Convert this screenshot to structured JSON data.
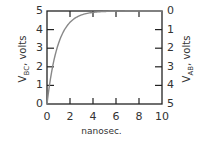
{
  "chart_data": {
    "type": "line",
    "title": "",
    "xlabel": "nanosec.",
    "ylabel_left": "V_BC, volts",
    "ylabel_right": "V_AB, volts",
    "xlim": [
      0,
      10
    ],
    "ylim_left": [
      0,
      5
    ],
    "ylim_right": [
      5,
      0
    ],
    "x_ticks": [
      "0",
      "2",
      "4",
      "6",
      "8",
      "10"
    ],
    "y_ticks_left": [
      "0",
      "1",
      "2",
      "3",
      "4",
      "5"
    ],
    "y_ticks_right": [
      "5",
      "4",
      "3",
      "2",
      "1",
      "0"
    ],
    "grid": false,
    "series": [
      {
        "name": "V_BC (charging curve)",
        "color": "#888888",
        "x": [
          0,
          0.5,
          1,
          1.5,
          2,
          2.5,
          3,
          3.5,
          4,
          5,
          6,
          7,
          8,
          10
        ],
        "y": [
          0,
          2.0,
          3.2,
          3.9,
          4.35,
          4.6,
          4.75,
          4.85,
          4.92,
          4.98,
          5.0,
          5.0,
          5.0,
          5.0
        ]
      }
    ]
  },
  "labels": {
    "ylabel_left_main": "V",
    "ylabel_left_sub": "BC",
    "ylabel_left_rest": ", volts",
    "ylabel_right_main": "V",
    "ylabel_right_sub": "AB",
    "ylabel_right_rest": ", volts",
    "xlabel": "nanosec."
  }
}
